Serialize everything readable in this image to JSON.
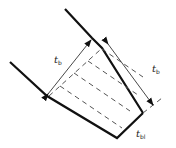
{
  "diagram": {
    "type": "weld cross-section with throat dimensions",
    "labels": {
      "left_dimension": {
        "main": "t",
        "sub": "b"
      },
      "right_dimension": {
        "main": "t",
        "sub": "b"
      },
      "bottom_dimension": {
        "main": "t",
        "sub": "bl"
      }
    },
    "colors": {
      "line": "#111111",
      "dashed": "#555555",
      "dimension": "#333333",
      "background": "#ffffff"
    }
  }
}
